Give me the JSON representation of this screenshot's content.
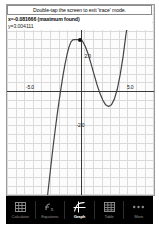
{
  "app": {
    "mode": "trace",
    "colors": {
      "curve": "#444444",
      "axis": "#3a3a3a",
      "grid": "#d6d6d6",
      "tabbar_bg": "#000000",
      "tab_active": "#ffffff",
      "tab_inactive": "#8a8a8a"
    }
  },
  "readout": {
    "banner": "Double-tap the screen to exit 'trace' mode.",
    "x_line": "x=-0.081666 (maximum found)",
    "y_line": "y=3.004111"
  },
  "graph": {
    "x_label_neg": "-5.0",
    "x_label_pos": "5.0",
    "y_label_pos": "2.0",
    "y_label_neg": "-2.0"
  },
  "tabbar": {
    "items": [
      {
        "label": "Calculator",
        "icon": "calculator-icon",
        "active": false
      },
      {
        "label": "Equations",
        "icon": "equations-icon",
        "active": false
      },
      {
        "label": "Graph",
        "icon": "graph-icon",
        "active": true
      },
      {
        "label": "Table",
        "icon": "table-icon",
        "active": false
      },
      {
        "label": "More",
        "icon": "more-icon",
        "active": false
      }
    ]
  },
  "chart_data": {
    "type": "line",
    "title": "",
    "xlabel": "",
    "ylabel": "",
    "xlim": [
      -7.6,
      7.6
    ],
    "ylim": [
      -6.0,
      5.0
    ],
    "grid": true,
    "legend": false,
    "xticks": [
      -5.0,
      5.0
    ],
    "yticks": [
      -2.0,
      2.0
    ],
    "annotations": [
      {
        "label": "maximum found",
        "x": -0.081666,
        "y": 3.004111,
        "marker": "dot"
      }
    ],
    "series": [
      {
        "name": "cubic",
        "x": [
          -3.4,
          -3.2,
          -3.0,
          -2.8,
          -2.6,
          -2.4,
          -2.2,
          -2.0,
          -1.8,
          -1.6,
          -1.4,
          -1.2,
          -1.0,
          -0.8,
          -0.6,
          -0.4,
          -0.2,
          -0.08,
          0.0,
          0.2,
          0.5,
          0.8,
          1.1,
          1.4,
          1.7,
          2.0,
          2.3,
          2.6,
          2.9,
          3.2,
          3.5,
          3.8,
          4.1,
          4.4,
          4.7,
          5.0,
          5.3,
          5.6
        ],
        "y": [
          -6.0,
          -5.0,
          -4.0,
          -3.05,
          -2.15,
          -1.3,
          -0.5,
          0.25,
          0.95,
          1.58,
          2.12,
          2.55,
          2.85,
          2.98,
          3.0,
          2.99,
          3.0,
          3.004,
          3.0,
          2.92,
          2.6,
          2.15,
          1.58,
          0.98,
          0.4,
          -0.1,
          -0.5,
          -0.78,
          -0.88,
          -0.78,
          -0.45,
          0.12,
          0.95,
          2.0,
          3.3,
          4.3,
          4.9,
          5.0
        ]
      }
    ]
  }
}
